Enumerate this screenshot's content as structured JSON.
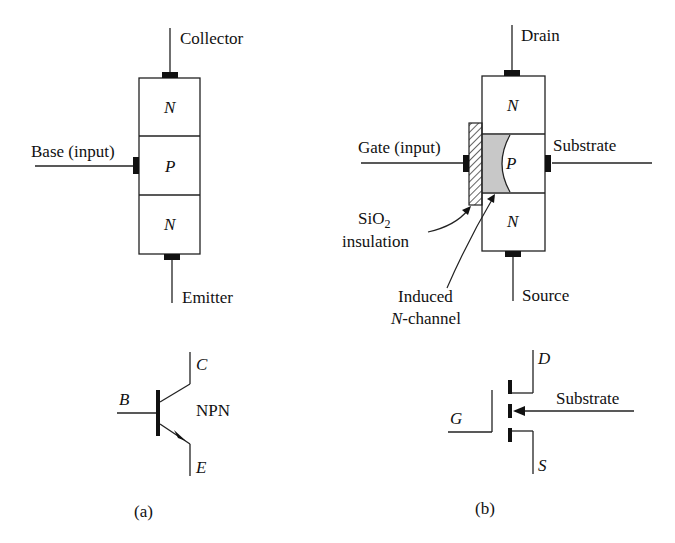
{
  "figure": {
    "a": {
      "caption": "(a)",
      "bjt_structure": {
        "terminals": {
          "collector": "Collector",
          "base": "Base (input)",
          "emitter": "Emitter"
        },
        "layers": [
          "N",
          "P",
          "N"
        ]
      },
      "symbol": {
        "terminals": {
          "c": "C",
          "b": "B",
          "e": "E"
        },
        "type_label": "NPN"
      }
    },
    "b": {
      "caption": "(b)",
      "mosfet_structure": {
        "terminals": {
          "drain": "Drain",
          "gate": "Gate (input)",
          "substrate": "Substrate",
          "source": "Source"
        },
        "layers": [
          "N",
          "P",
          "N"
        ],
        "oxide_label_main": "SiO",
        "oxide_label_sub": "2",
        "oxide_label_line2": "insulation",
        "channel_label_line1": "Induced",
        "channel_label_italic": "N",
        "channel_label_rest": "-channel"
      },
      "symbol": {
        "terminals": {
          "d": "D",
          "g": "G",
          "s": "S"
        },
        "substrate_label": "Substrate"
      }
    }
  }
}
